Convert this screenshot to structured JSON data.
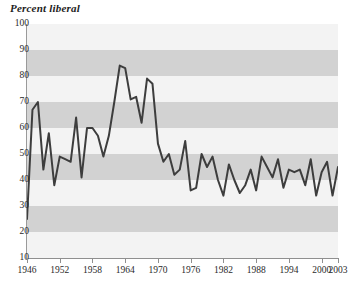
{
  "chart_data": {
    "type": "line",
    "title": "Percent liberal",
    "xlabel": "",
    "ylabel": "Percent liberal",
    "xlim": [
      1946,
      2003
    ],
    "ylim": [
      10,
      100
    ],
    "ytick_step": 10,
    "yticks": [
      10,
      20,
      30,
      40,
      50,
      60,
      70,
      80,
      90,
      100
    ],
    "ytick_labels": [
      "10",
      "20",
      "30",
      "40",
      "50",
      "60",
      "70",
      "80",
      "90",
      "100"
    ],
    "xticks": [
      1946,
      1952,
      1958,
      1964,
      1970,
      1976,
      1982,
      1988,
      1994,
      2000,
      2003
    ],
    "xtick_labels": [
      "1946",
      "1952",
      "1958",
      "1964",
      "1970",
      "1976",
      "1982",
      "1988",
      "1994",
      "2000",
      "2003"
    ],
    "grid": false,
    "banding": "alternating horizontal bands every 10 units",
    "legend": null,
    "line_color": "#3d3d3d",
    "band_dark_color": "#d2d2d2",
    "band_light_color": "#f3f3f3",
    "axis_color": "#8f8f8f",
    "x": [
      1946,
      1947,
      1948,
      1949,
      1950,
      1951,
      1952,
      1953,
      1954,
      1955,
      1956,
      1957,
      1958,
      1959,
      1960,
      1961,
      1962,
      1963,
      1964,
      1965,
      1966,
      1967,
      1968,
      1969,
      1970,
      1971,
      1972,
      1973,
      1974,
      1975,
      1976,
      1977,
      1978,
      1979,
      1980,
      1981,
      1982,
      1983,
      1984,
      1985,
      1986,
      1987,
      1988,
      1989,
      1990,
      1991,
      1992,
      1993,
      1994,
      1995,
      1996,
      1997,
      1998,
      1999,
      2000,
      2001,
      2002,
      2003
    ],
    "values": [
      25,
      67,
      70,
      44,
      58,
      38,
      49,
      48,
      47,
      64,
      41,
      60,
      60,
      57,
      49,
      57,
      70,
      84,
      83,
      71,
      72,
      62,
      79,
      77,
      54,
      47,
      50,
      42,
      44,
      55,
      36,
      37,
      50,
      45,
      49,
      40,
      34,
      46,
      40,
      35,
      38,
      44,
      36,
      49,
      45,
      41,
      48,
      37,
      44,
      43,
      44,
      38,
      48,
      34,
      43,
      47,
      34,
      45
    ],
    "series": [
      {
        "name": "Percent liberal",
        "values": [
          25,
          67,
          70,
          44,
          58,
          38,
          49,
          48,
          47,
          64,
          41,
          60,
          60,
          57,
          49,
          57,
          70,
          84,
          83,
          71,
          72,
          62,
          79,
          77,
          54,
          47,
          50,
          42,
          44,
          55,
          36,
          37,
          50,
          45,
          49,
          40,
          34,
          46,
          40,
          35,
          38,
          44,
          36,
          49,
          45,
          41,
          48,
          37,
          44,
          43,
          44,
          38,
          48,
          34,
          43,
          47,
          34,
          45
        ]
      }
    ]
  }
}
